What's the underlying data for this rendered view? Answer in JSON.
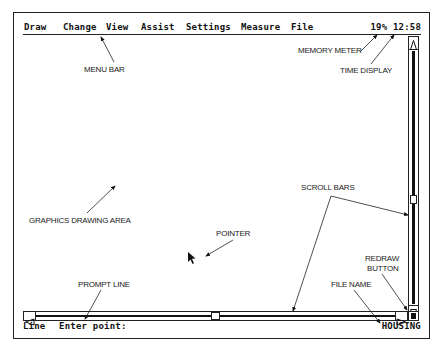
{
  "menubar": {
    "items": [
      {
        "label": "Draw"
      },
      {
        "label": "Change"
      },
      {
        "label": "View"
      },
      {
        "label": "Assist"
      },
      {
        "label": "Settings"
      },
      {
        "label": "Measure"
      },
      {
        "label": "File"
      }
    ],
    "memory_meter": "19%",
    "time_display": "12:58"
  },
  "prompt": {
    "command": "Line",
    "message": "Enter point:",
    "file_name": "HOUSING"
  },
  "scrollbars": {
    "up_arrow": "up-arrow",
    "down_arrow": "down-arrow",
    "left_arrow": "left-arrow",
    "right_arrow": "right-arrow"
  },
  "annotations": {
    "menu_bar": "MENU BAR",
    "memory_meter": "MEMORY METER",
    "time_display": "TIME DISPLAY",
    "graphics_drawing_area": "GRAPHICS DRAWING AREA",
    "pointer": "POINTER",
    "scroll_bars": "SCROLL BARS",
    "redraw_button_line1": "REDRAW",
    "redraw_button_line2": "BUTTON",
    "prompt_line": "PROMPT LINE",
    "file_name": "FILE NAME"
  }
}
